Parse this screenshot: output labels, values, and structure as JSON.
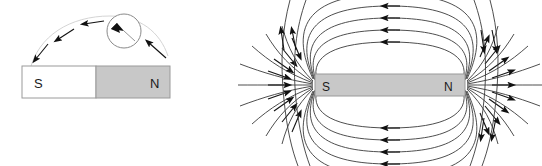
{
  "figure": {
    "background_color": "#ffffff",
    "line_color": "#3a3a3a",
    "arrow_color": "#111111",
    "panels": [
      {
        "id": "compass-panel",
        "name": "compass-near-bar-magnet",
        "magnet": {
          "name": "bar-magnet-left",
          "x": 22,
          "y": 66,
          "width": 148,
          "height": 32,
          "border_color": "#8c8c8c",
          "south": {
            "label": "S",
            "fill": "#ffffff",
            "label_x": 34,
            "label_y": 87
          },
          "north": {
            "label": "N",
            "fill": "#c8c8c8",
            "label_x": 152,
            "label_y": 87
          },
          "split_x": 96
        },
        "compass": {
          "name": "compass",
          "cx": 124,
          "cy": 31,
          "r": 17,
          "stroke": "#6e6e6e",
          "needle_angle_deg": 205
        },
        "field_arrows": [
          {
            "x": 38,
            "y": 58,
            "angle_deg": 118
          },
          {
            "x": 62,
            "y": 37,
            "angle_deg": 147
          },
          {
            "x": 92,
            "y": 24,
            "angle_deg": 172
          },
          {
            "x": 152,
            "y": 46,
            "angle_deg": 228
          }
        ]
      },
      {
        "id": "dipole-panel",
        "name": "magnetic-field-lines-of-bar-magnet",
        "magnet": {
          "name": "bar-magnet-right",
          "x": 315,
          "y": 74,
          "width": 150,
          "height": 22,
          "fill": "#c8c8c8",
          "border_color": "#8c8c8c",
          "south": {
            "label": "S",
            "label_x": 325,
            "label_y": 90
          },
          "north": {
            "label": "N",
            "label_x": 447,
            "label_y": 90
          }
        },
        "field_direction": "from N pole outward, looping around to S pole",
        "loop_count_per_side": 5
      }
    ]
  }
}
